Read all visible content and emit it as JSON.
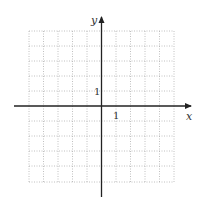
{
  "diagram": {
    "type": "coordinate-grid",
    "x_axis_label": "x",
    "y_axis_label": "y",
    "x_tick_label": "1",
    "y_tick_label": "1",
    "x_range": [
      -5,
      5
    ],
    "y_range": [
      -5,
      5
    ],
    "grid_step": 1,
    "grid_style": "dotted",
    "colors": {
      "axis": "#222222",
      "grid": "#b0b0b0",
      "background": "#ffffff"
    }
  }
}
